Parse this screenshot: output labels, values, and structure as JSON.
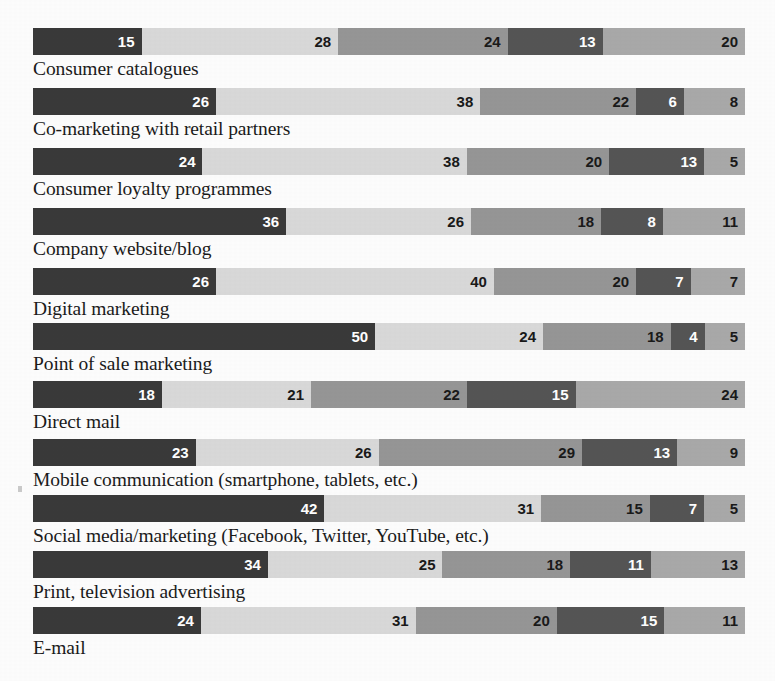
{
  "chart_data": {
    "type": "bar",
    "subtype": "stacked-horizontal-100-percent",
    "title": "",
    "xlabel": "",
    "ylabel": "",
    "xlim": [
      0,
      100
    ],
    "grid": false,
    "legend": "none",
    "orientation": "horizontal",
    "stacked": true,
    "categories": [
      "Consumer catalogues",
      "Co-marketing with retail partners",
      "Consumer loyalty programmes",
      "Company website/blog",
      "Digital marketing",
      "Point of sale marketing",
      "Direct mail",
      "Mobile communication (smartphone, tablets, etc.)",
      "Social media/marketing (Facebook, Twitter, YouTube, etc.)",
      "Print, television advertising",
      "E-mail"
    ],
    "series": [
      {
        "name": "Segment 1",
        "color": "#3a3a3a",
        "label_color": "#ffffff",
        "values": [
          15,
          26,
          24,
          36,
          26,
          50,
          18,
          23,
          42,
          34,
          24
        ]
      },
      {
        "name": "Segment 2",
        "color": "#d9d9d9",
        "label_color": "#1a1a1a",
        "values": [
          28,
          38,
          38,
          26,
          40,
          24,
          21,
          26,
          31,
          25,
          31
        ]
      },
      {
        "name": "Segment 3",
        "color": "#969696",
        "label_color": "#1a1a1a",
        "values": [
          24,
          22,
          20,
          18,
          20,
          18,
          22,
          29,
          15,
          18,
          20
        ]
      },
      {
        "name": "Segment 4",
        "color": "#555555",
        "label_color": "#ffffff",
        "values": [
          13,
          6,
          13,
          8,
          7,
          4,
          15,
          13,
          7,
          11,
          15
        ]
      },
      {
        "name": "Segment 5",
        "color": "#a9a9a9",
        "label_color": "#1a1a1a",
        "values": [
          20,
          8,
          5,
          11,
          7,
          5,
          24,
          9,
          5,
          13,
          11
        ]
      }
    ],
    "value_labels": {
      "Consumer catalogues": [
        "15",
        "28",
        "24",
        "13",
        "20"
      ],
      "Co-marketing with retail partners": [
        "26",
        "38",
        "22",
        "6",
        "8"
      ],
      "Consumer loyalty programmes": [
        "24",
        "38",
        "20",
        "13",
        "5"
      ],
      "Company website/blog": [
        "36",
        "26",
        "18",
        "8",
        "11"
      ],
      "Digital marketing": [
        "26",
        "40",
        "20",
        "7",
        "7"
      ],
      "Point of sale marketing": [
        "50",
        "24",
        "18",
        "4",
        "5"
      ],
      "Direct mail": [
        "18",
        "21",
        "22",
        "15",
        "24"
      ],
      "Mobile communication (smartphone, tablets, etc.)": [
        "23",
        "26",
        "29",
        "13",
        "9"
      ],
      "Social media/marketing (Facebook, Twitter, YouTube, etc.)": [
        "42",
        "31",
        "15",
        "7",
        "5"
      ],
      "Print, television advertising": [
        "34",
        "25",
        "18",
        "11",
        "13"
      ],
      "E-mail": [
        "24",
        "31",
        "20",
        "15",
        "11"
      ]
    }
  },
  "colors": {
    "segment_1": "#3a3a3a",
    "segment_2": "#d9d9d9",
    "segment_3": "#969696",
    "segment_4": "#555555",
    "segment_5": "#a9a9a9",
    "background": "#fdfdfd",
    "label_text": "#1b1b1b"
  }
}
